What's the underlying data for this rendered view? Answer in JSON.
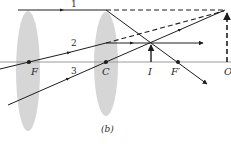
{
  "figure": {
    "caption": "(b)",
    "colors": {
      "lens": "#d6d6d6",
      "axis": "#9a9a9a",
      "ray": "#1e1e1e"
    },
    "labels": {
      "F": "F",
      "C": "C",
      "I": "I",
      "F_prime": "F′",
      "O": "O"
    },
    "rays": [
      {
        "id": "1",
        "label": "1"
      },
      {
        "id": "2",
        "label": "2"
      },
      {
        "id": "3",
        "label": "3"
      }
    ]
  }
}
